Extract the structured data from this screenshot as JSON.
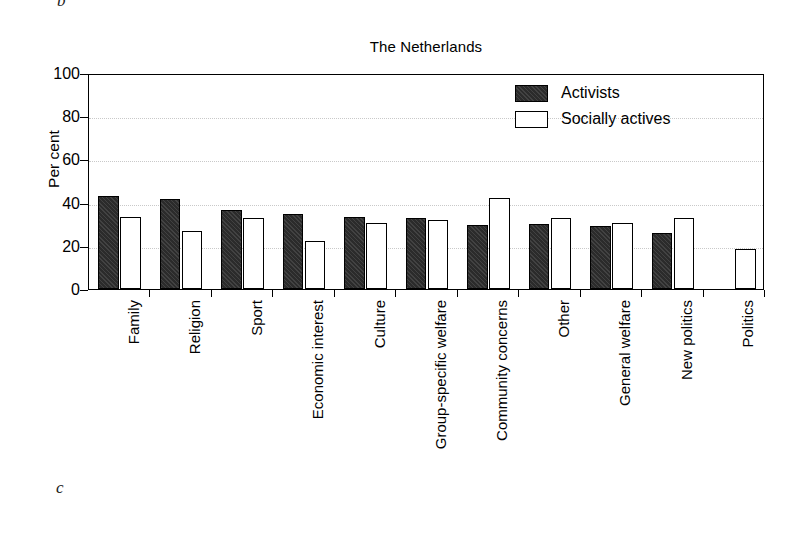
{
  "page": {
    "mark_top": "b",
    "mark_bottom": "c"
  },
  "legend": {
    "position": "top-right-inside",
    "items": [
      {
        "label": "Activists",
        "swatch": "filled-dark-square",
        "color": "#2b2b2b"
      },
      {
        "label": "Socially actives",
        "swatch": "open-white-square",
        "color": "#ffffff"
      }
    ]
  },
  "chart_data": {
    "type": "bar",
    "title": "The Netherlands",
    "xlabel": "",
    "ylabel": "Per cent",
    "ylim": [
      0,
      100
    ],
    "yticks": [
      0,
      20,
      40,
      60,
      80,
      100
    ],
    "grid": "horizontal-dotted",
    "categories": [
      "Family",
      "Religion",
      "Sport",
      "Economic interest",
      "Culture",
      "Group-specific welfare",
      "Community concerns",
      "Other",
      "General welfare",
      "New politics",
      "Politics"
    ],
    "series": [
      {
        "name": "Activists",
        "color": "#2b2b2b",
        "values": [
          43,
          41.5,
          36.5,
          34.5,
          33.5,
          33,
          29.5,
          30,
          29,
          26,
          0
        ]
      },
      {
        "name": "Socially actives",
        "color": "#ffffff",
        "values": [
          33.5,
          27,
          33,
          22,
          30.5,
          32,
          42,
          33,
          30.5,
          33,
          18.5
        ]
      }
    ]
  }
}
